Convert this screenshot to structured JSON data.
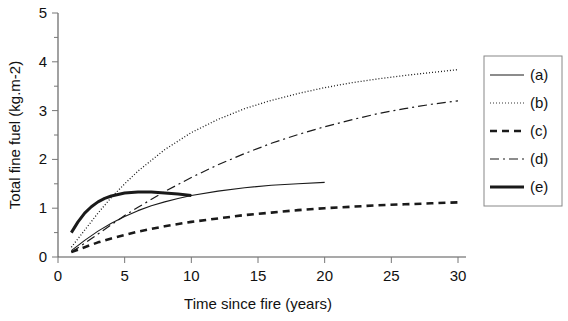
{
  "chart_data": {
    "type": "line",
    "title": "",
    "xlabel": "Time since fire (years)",
    "ylabel": "Total fine fuel (kg.m-2)",
    "xlim": [
      0,
      30
    ],
    "ylim": [
      0,
      5
    ],
    "xticks": [
      0,
      5,
      10,
      15,
      20,
      25,
      30
    ],
    "yticks": [
      0,
      1,
      2,
      3,
      4,
      5
    ],
    "xticklabels": [
      "0",
      "5",
      "10",
      "15",
      "20",
      "25",
      "30"
    ],
    "yticklabels": [
      "0",
      "1",
      "2",
      "3",
      "4",
      "5"
    ],
    "minor_yticks": [
      0.5,
      1.5,
      2.5,
      3.5,
      4.5
    ],
    "grid": false,
    "legend_position": "right",
    "series": [
      {
        "name": "(a)",
        "label": "(a)",
        "style": "solid-thin",
        "color": "#1a1a1a",
        "width": 1.1,
        "dash": "none",
        "x": [
          1,
          2,
          3,
          4,
          5,
          6,
          7,
          8,
          9,
          10,
          12,
          14,
          16,
          18,
          20
        ],
        "y": [
          0.13,
          0.34,
          0.53,
          0.69,
          0.83,
          0.95,
          1.05,
          1.13,
          1.2,
          1.26,
          1.35,
          1.42,
          1.47,
          1.5,
          1.53
        ]
      },
      {
        "name": "(b)",
        "label": "(b)",
        "style": "dotted",
        "color": "#7a7a7a",
        "width": 1.3,
        "dash": "1,2",
        "x": [
          1,
          2,
          3,
          4,
          5,
          6,
          8,
          10,
          12,
          14,
          16,
          18,
          20,
          22,
          24,
          26,
          28,
          30
        ],
        "y": [
          0.2,
          0.55,
          0.9,
          1.22,
          1.5,
          1.76,
          2.2,
          2.55,
          2.82,
          3.04,
          3.21,
          3.35,
          3.47,
          3.57,
          3.65,
          3.72,
          3.78,
          3.84
        ]
      },
      {
        "name": "(c)",
        "label": "(c)",
        "style": "dashed-thick",
        "color": "#1a1a1a",
        "width": 2.6,
        "dash": "7,5",
        "x": [
          1,
          2,
          3,
          4,
          5,
          6,
          8,
          10,
          12,
          14,
          16,
          18,
          20,
          22,
          24,
          26,
          28,
          30
        ],
        "y": [
          0.1,
          0.2,
          0.3,
          0.38,
          0.45,
          0.52,
          0.63,
          0.72,
          0.79,
          0.86,
          0.91,
          0.96,
          1.0,
          1.03,
          1.06,
          1.08,
          1.1,
          1.12
        ]
      },
      {
        "name": "(d)",
        "label": "(d)",
        "style": "dash-dot",
        "color": "#1a1a1a",
        "width": 1.2,
        "dash": "9,4,2,4",
        "x": [
          1,
          2,
          3,
          4,
          5,
          6,
          8,
          10,
          12,
          14,
          16,
          18,
          20,
          22,
          24,
          26,
          28,
          30
        ],
        "y": [
          0.1,
          0.28,
          0.47,
          0.66,
          0.85,
          1.02,
          1.34,
          1.63,
          1.89,
          2.12,
          2.33,
          2.51,
          2.67,
          2.81,
          2.94,
          3.04,
          3.13,
          3.2
        ]
      },
      {
        "name": "(e)",
        "label": "(e)",
        "style": "solid-thick",
        "color": "#1a1a1a",
        "width": 3.0,
        "dash": "none",
        "x": [
          1,
          1.5,
          2,
          2.5,
          3,
          3.5,
          4,
          5,
          6,
          7,
          8,
          9,
          10
        ],
        "y": [
          0.5,
          0.72,
          0.9,
          1.03,
          1.13,
          1.2,
          1.25,
          1.31,
          1.33,
          1.33,
          1.31,
          1.29,
          1.26
        ]
      }
    ]
  },
  "legend": {
    "items": [
      {
        "label": "(a)"
      },
      {
        "label": "(b)"
      },
      {
        "label": "(c)"
      },
      {
        "label": "(d)"
      },
      {
        "label": "(e)"
      }
    ]
  }
}
